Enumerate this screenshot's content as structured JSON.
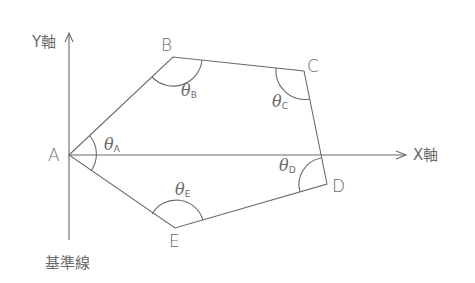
{
  "diagram": {
    "type": "polygon-traverse",
    "axes": {
      "y_label": "Y軸",
      "x_label": "X軸",
      "baseline_label": "基準線"
    },
    "vertices": [
      {
        "id": "A",
        "label": "A"
      },
      {
        "id": "B",
        "label": "B"
      },
      {
        "id": "C",
        "label": "C"
      },
      {
        "id": "D",
        "label": "D"
      },
      {
        "id": "E",
        "label": "E"
      }
    ],
    "angles": [
      {
        "symbol": "θ",
        "sub": "A"
      },
      {
        "symbol": "θ",
        "sub": "B"
      },
      {
        "symbol": "θ",
        "sub": "C"
      },
      {
        "symbol": "θ",
        "sub": "D"
      },
      {
        "symbol": "θ",
        "sub": "E"
      }
    ],
    "colors": {
      "line": "#6a6a6a",
      "text": "#6a6a6a",
      "background": "#ffffff"
    }
  }
}
